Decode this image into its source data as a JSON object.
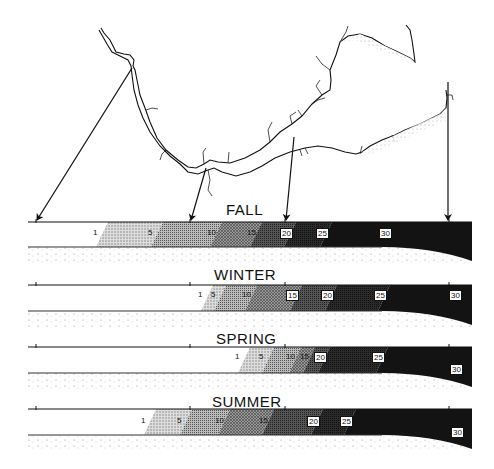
{
  "figure": {
    "map": {
      "arrow_targets_x": [
        36,
        190,
        285,
        449
      ]
    },
    "sections": [
      {
        "title": "FALL",
        "title_x": 226,
        "title_y": 201,
        "top": 222,
        "bottom": 247,
        "labels": [
          {
            "text": "1",
            "x": 96,
            "y": 232,
            "boxed": false
          },
          {
            "text": "5",
            "x": 151,
            "y": 232,
            "boxed": false
          },
          {
            "text": "10",
            "x": 210,
            "y": 232,
            "boxed": false
          },
          {
            "text": "15",
            "x": 250,
            "y": 232,
            "boxed": false
          },
          {
            "text": "20",
            "x": 284,
            "y": 232,
            "boxed": true
          },
          {
            "text": "25",
            "x": 320,
            "y": 232,
            "boxed": true
          },
          {
            "text": "30",
            "x": 383,
            "y": 232,
            "boxed": true
          }
        ]
      },
      {
        "title": "WINTER",
        "title_x": 214,
        "title_y": 266,
        "top": 285,
        "bottom": 311,
        "labels": [
          {
            "text": "1",
            "x": 201,
            "y": 294,
            "boxed": false
          },
          {
            "text": "5",
            "x": 214,
            "y": 294,
            "boxed": false
          },
          {
            "text": "10",
            "x": 245,
            "y": 294,
            "boxed": false
          },
          {
            "text": "15",
            "x": 290,
            "y": 294,
            "boxed": true
          },
          {
            "text": "20",
            "x": 325,
            "y": 294,
            "boxed": true
          },
          {
            "text": "25",
            "x": 378,
            "y": 294,
            "boxed": true
          },
          {
            "text": "30",
            "x": 453,
            "y": 294,
            "boxed": true
          }
        ]
      },
      {
        "title": "SPRING",
        "title_x": 216,
        "title_y": 330,
        "top": 347,
        "bottom": 373,
        "labels": [
          {
            "text": "1",
            "x": 238,
            "y": 356,
            "boxed": false
          },
          {
            "text": "5",
            "x": 262,
            "y": 356,
            "boxed": false
          },
          {
            "text": "10",
            "x": 289,
            "y": 356,
            "boxed": false
          },
          {
            "text": "15",
            "x": 303,
            "y": 356,
            "boxed": false
          },
          {
            "text": "20",
            "x": 318,
            "y": 356,
            "boxed": true
          },
          {
            "text": "25",
            "x": 376,
            "y": 356,
            "boxed": true
          },
          {
            "text": "30",
            "x": 454,
            "y": 368,
            "boxed": true
          }
        ]
      },
      {
        "title": "SUMMER",
        "title_x": 212,
        "title_y": 393,
        "top": 409,
        "bottom": 435,
        "labels": [
          {
            "text": "1",
            "x": 144,
            "y": 420,
            "boxed": false
          },
          {
            "text": "5",
            "x": 180,
            "y": 420,
            "boxed": false
          },
          {
            "text": "10",
            "x": 218,
            "y": 420,
            "boxed": false
          },
          {
            "text": "15",
            "x": 262,
            "y": 420,
            "boxed": false
          },
          {
            "text": "20",
            "x": 311,
            "y": 420,
            "boxed": true
          },
          {
            "text": "25",
            "x": 344,
            "y": 420,
            "boxed": true
          },
          {
            "text": "30",
            "x": 455,
            "y": 431,
            "boxed": true
          }
        ]
      }
    ],
    "colors": {
      "ink": "#111111",
      "paper": "#ffffff",
      "zone_5_10": "#e2e2e2",
      "zone_10_15": "#c8c8c8",
      "zone_15_20": "#a8a8a8",
      "zone_20_25": "#6a6a6a",
      "zone_25_30": "#303030",
      "zone_30": "#141414"
    }
  }
}
